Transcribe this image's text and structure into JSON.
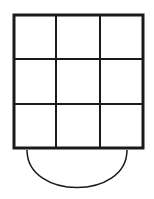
{
  "diagram": {
    "grid": {
      "rows": 3,
      "cols": 3,
      "x": 13,
      "y": 14,
      "width": 131,
      "height": 135,
      "col_lines": [
        56,
        100
      ],
      "row_lines": [
        59,
        104
      ],
      "outer_stroke_color": "#1a1a1a",
      "outer_stroke_width": 3,
      "inner_stroke_color": "#1a1a1a",
      "inner_stroke_width": 2
    },
    "semicircle": {
      "x_start": 27,
      "x_end": 127,
      "top_y": 149,
      "bottom_y": 188,
      "stroke_color": "#1a1a1a",
      "stroke_width": 1.5
    }
  }
}
